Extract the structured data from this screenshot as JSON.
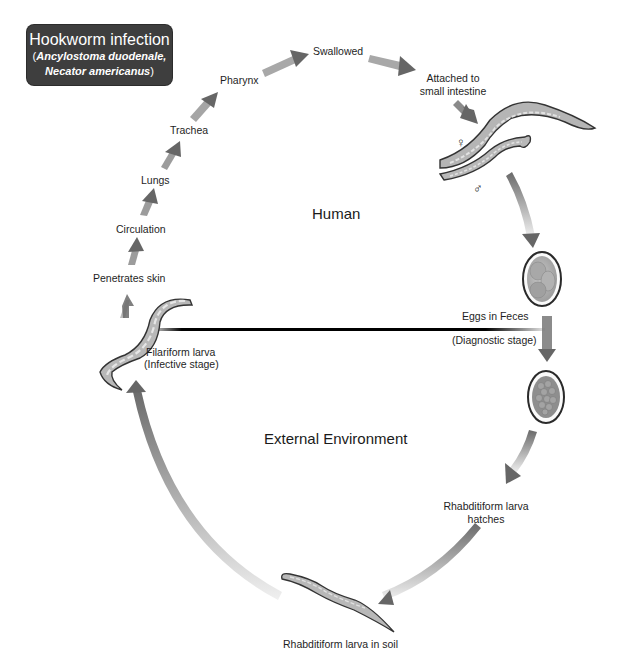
{
  "title": {
    "main": "Hookworm infection",
    "species_line1": "Ancylostoma duodenale,",
    "species_line2": "Necator americanus",
    "open_paren": "(",
    "close_paren": ")"
  },
  "regions": {
    "upper": "Human",
    "lower": "External Environment"
  },
  "stages": {
    "swallowed": "Swallowed",
    "attached_line1": "Attached to",
    "attached_line2": "small intestine",
    "pharynx": "Pharynx",
    "trachea": "Trachea",
    "lungs": "Lungs",
    "circulation": "Circulation",
    "penetrates": "Penetrates skin",
    "filariform_line1": "Filariform larva",
    "filariform_line2": "(Infective stage)",
    "eggs_line1": "Eggs in Feces",
    "eggs_line2": "(Diagnostic stage)",
    "rhabditiform_hatch_line1": "Rhabditiform larva",
    "rhabditiform_hatch_line2": "hatches",
    "rhabditiform_soil": "Rhabditiform larva in soil"
  },
  "symbols": {
    "female": "♀",
    "male": "♂"
  },
  "colors": {
    "arrow": "#6a6a6a",
    "title_bg": "#3e3e3e",
    "worm_fill": "#b8b8b8",
    "divider": "#000000"
  }
}
